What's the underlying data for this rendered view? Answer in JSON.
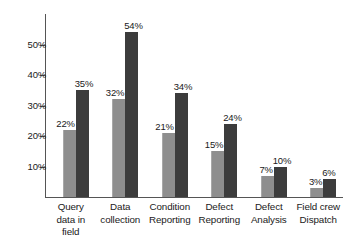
{
  "chart_data": {
    "type": "bar",
    "title": "",
    "subtitle": "",
    "xlabel": "",
    "ylabel": "",
    "ylim": [
      0,
      60
    ],
    "grid": false,
    "legend_position": "none",
    "y_ticks": [
      "10%",
      "20%",
      "30%",
      "40%",
      "50%"
    ],
    "y_tick_values": [
      10,
      20,
      30,
      40,
      50
    ],
    "categories": [
      "Query data in field",
      "Data collection",
      "Condition Reporting",
      "Defect Reporting",
      "Defect Analysis",
      "Field crew Dispatch"
    ],
    "category_lines": [
      [
        "Query",
        "data in",
        "field"
      ],
      [
        "Data",
        "collection"
      ],
      [
        "Condition",
        "Reporting"
      ],
      [
        "Defect",
        "Reporting"
      ],
      [
        "Defect",
        "Analysis"
      ],
      [
        "Field crew",
        "Dispatch"
      ]
    ],
    "series": [
      {
        "name": "Series 1",
        "color": "#8e8e8e",
        "values": [
          22,
          32,
          21,
          15,
          7,
          3
        ],
        "labels": [
          "22%",
          "32%",
          "21%",
          "15%",
          "7%",
          "3%"
        ]
      },
      {
        "name": "Series 2",
        "color": "#3c3c3c",
        "values": [
          35,
          54,
          34,
          24,
          10,
          6
        ],
        "labels": [
          "35%",
          "54%",
          "34%",
          "24%",
          "10%",
          "6%"
        ]
      }
    ]
  },
  "colors": {
    "series_light": "#8e8e8e",
    "series_dark": "#3c3c3c",
    "axis": "#555555",
    "text": "#1a1a1a",
    "background": "#ffffff"
  }
}
